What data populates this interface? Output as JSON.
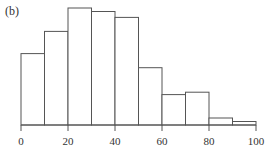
{
  "chart_data": {
    "type": "bar",
    "subtype": "histogram",
    "title": "",
    "panel_label": "(b)",
    "xlabel": "",
    "ylabel": "",
    "bin_edges": [
      0,
      10,
      20,
      30,
      40,
      50,
      60,
      70,
      80,
      90,
      100
    ],
    "categories": [
      "0-10",
      "10-20",
      "20-30",
      "30-40",
      "40-50",
      "50-60",
      "60-70",
      "70-80",
      "80-90",
      "90-100"
    ],
    "values": [
      61,
      80,
      100,
      97,
      92,
      49,
      26,
      28,
      6,
      3
    ],
    "value_note": "relative bar heights (tallest = 100); no y-axis shown",
    "xlim": [
      0,
      100
    ],
    "xticks": [
      0,
      20,
      40,
      60,
      80,
      100
    ],
    "xtick_labels": [
      "0",
      "20",
      "40",
      "60",
      "80",
      "100"
    ],
    "y_axis_visible": false,
    "grid": false,
    "legend": null,
    "bar_fill": "#ffffff",
    "bar_edge": "#555555"
  }
}
